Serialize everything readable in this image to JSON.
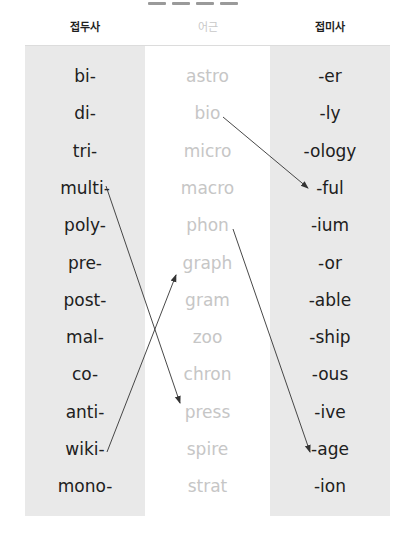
{
  "headers": {
    "prefix": "접두사",
    "root": "어근",
    "suffix": "접미사"
  },
  "columns": {
    "prefixes": [
      "bi-",
      "di-",
      "tri-",
      "multi-",
      "poly-",
      "pre-",
      "post-",
      "mal-",
      "co-",
      "anti-",
      "wiki-",
      "mono-"
    ],
    "roots": [
      "astro",
      "bio",
      "micro",
      "macro",
      "phon",
      "graph",
      "gram",
      "zoo",
      "chron",
      "press",
      "spire",
      "strat"
    ],
    "suffixes": [
      "-er",
      "-ly",
      "-ology",
      "-ful",
      "-ium",
      "-or",
      "-able",
      "-ship",
      "-ous",
      "-ive",
      "-age",
      "-ion"
    ]
  },
  "connections": [
    {
      "from": "bio",
      "to": "-ful"
    },
    {
      "from": "multi-",
      "to": "press"
    },
    {
      "from": "phon",
      "to": "-age"
    },
    {
      "from": "wiki-",
      "to": "graph"
    }
  ],
  "colors": {
    "side_column_bg": "#e9e9e9",
    "root_text": "#c6c6c6",
    "affix_text": "#202020",
    "arrow": "#333333"
  }
}
